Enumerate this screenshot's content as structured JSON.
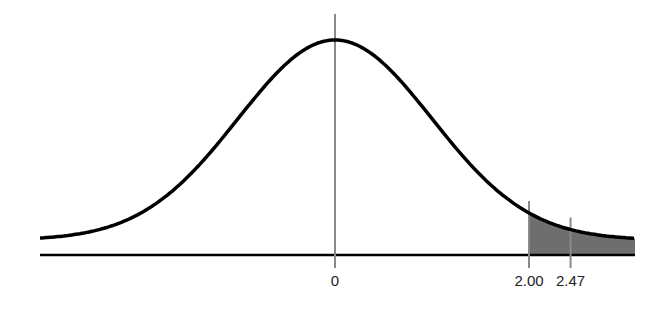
{
  "diagram": {
    "type": "normal-distribution-curve",
    "center_label": "0",
    "markers": [
      {
        "label": "2.00",
        "z": 2.0
      },
      {
        "label": "2.47",
        "z": 2.47
      }
    ],
    "shaded_region": {
      "from_z": 2.0,
      "to": "right-tail"
    },
    "colors": {
      "curve": "#000000",
      "shade": "#6e6e6e",
      "marker_lines": "#8a8a8a",
      "axis": "#000000"
    }
  }
}
